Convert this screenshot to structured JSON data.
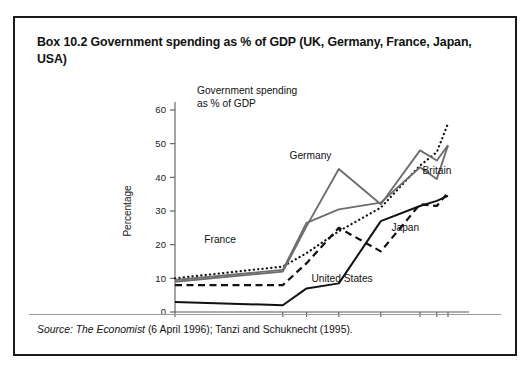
{
  "box": {
    "title": "Box 10.2  Government spending as % of GDP (UK, Germany, France, Japan, USA)",
    "source_prefix": "Source:",
    "source_italic": "The Economist",
    "source_rest": " (6 April 1996); Tanzi and Schuknecht (1995)."
  },
  "chart_data": {
    "type": "line",
    "title": "Government spending as % of GDP",
    "title_line1": "Government spending",
    "title_line2": "as % of GDP",
    "xlabel": "",
    "ylabel": "Percentage",
    "grid": false,
    "legend": "inline-annotations",
    "x": [
      1870,
      1913,
      1920,
      1937,
      1960,
      1980,
      1990,
      1994
    ],
    "xtick_labels": [
      "1870",
      "1913",
      "20",
      "37",
      "60",
      "80",
      "90",
      "94"
    ],
    "ytick_labels": [
      "0",
      "10",
      "20",
      "30",
      "40",
      "50",
      "60"
    ],
    "yticks": [
      0,
      10,
      20,
      30,
      40,
      50,
      60
    ],
    "ylim": [
      0,
      60
    ],
    "xlim": [
      1870,
      1994
    ],
    "series": [
      {
        "name": "France",
        "label": "France",
        "style": "dotted",
        "color": "#111111",
        "values": [
          10.0,
          13.5,
          17.5,
          24.0,
          31.0,
          43.5,
          47.5,
          56.0
        ],
        "label_x": 1890,
        "label_y": 20.5
      },
      {
        "name": "Britain",
        "label": "Britain",
        "style": "solid-gray",
        "color": "#6e6e6e",
        "values": [
          9.5,
          12.5,
          26.5,
          30.5,
          32.5,
          43.0,
          39.5,
          49.5
        ],
        "label_x": 1986,
        "label_y": 41.0
      },
      {
        "name": "Germany",
        "label": "Germany",
        "style": "solid-gray",
        "color": "#6e6e6e",
        "values": [
          9.0,
          12.0,
          25.5,
          42.5,
          32.0,
          48.0,
          45.0,
          49.5
        ],
        "label_x": 1930,
        "label_y": 45.5
      },
      {
        "name": "Japan",
        "label": "Japan",
        "style": "dashed",
        "color": "#111111",
        "values": [
          8.0,
          8.0,
          14.5,
          25.0,
          18.0,
          32.0,
          31.5,
          35.5
        ],
        "label_x": 1972,
        "label_y": 24.0
      },
      {
        "name": "United States",
        "label": "United States",
        "style": "solid-black",
        "color": "#111111",
        "values": [
          3.0,
          2.0,
          7.0,
          8.5,
          27.0,
          31.5,
          33.0,
          34.5
        ],
        "label_x": 1944,
        "label_y": 9.0
      }
    ]
  }
}
